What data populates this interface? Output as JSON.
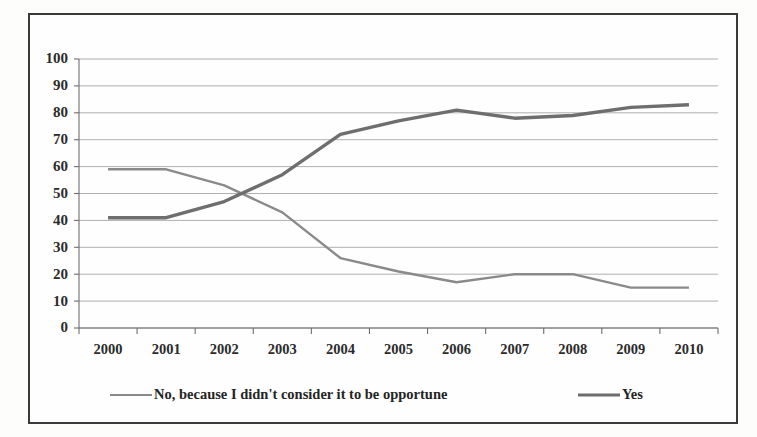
{
  "chart_data": {
    "type": "line",
    "title": "",
    "subtitle": "",
    "xlabel": "",
    "ylabel": "",
    "categories": [
      "2000",
      "2001",
      "2002",
      "2003",
      "2004",
      "2005",
      "2006",
      "2007",
      "2008",
      "2009",
      "2010"
    ],
    "x": [
      2000,
      2001,
      2002,
      2003,
      2004,
      2005,
      2006,
      2007,
      2008,
      2009,
      2010
    ],
    "series": [
      {
        "name": "No, because I didn't consider it to be opportune",
        "values": [
          59,
          59,
          53,
          43,
          26,
          21,
          17,
          20,
          20,
          15,
          15
        ],
        "color": "#8a8a8a",
        "stroke_width": 2.4
      },
      {
        "name": "Yes",
        "values": [
          41,
          41,
          47,
          57,
          72,
          77,
          81,
          78,
          79,
          82,
          83
        ],
        "color": "#6e6e6e",
        "stroke_width": 3.4
      }
    ],
    "ylim": [
      0,
      100
    ],
    "ytick_values": [
      0,
      10,
      20,
      30,
      40,
      50,
      60,
      70,
      80,
      90,
      100
    ],
    "ytick_labels": [
      "0",
      "10",
      "20",
      "30",
      "40",
      "50",
      "60",
      "70",
      "80",
      "90",
      "100"
    ],
    "grid": true,
    "grid_axis": "y",
    "legend_position": "bottom",
    "legend_entries": [
      {
        "label": "No, because I didn't consider it to be opportune",
        "color": "#8a8a8a",
        "stroke_width": 2.0
      },
      {
        "label": "Yes",
        "color": "#6e6e6e",
        "stroke_width": 3.2
      }
    ],
    "border_color": "#3a3a3a",
    "background_color": "#fefefe"
  }
}
